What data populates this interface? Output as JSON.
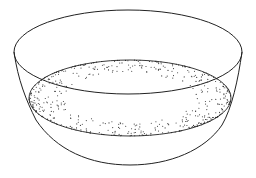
{
  "figure": {
    "background": "#ffffff",
    "stroke_color": "#222222",
    "dot_color": "#333333",
    "parts": [
      {
        "name": "bowl-rim",
        "type": "ellipse"
      },
      {
        "name": "contents-surface",
        "type": "stippled-ellipse"
      },
      {
        "name": "bowl-body",
        "type": "outline"
      }
    ]
  }
}
